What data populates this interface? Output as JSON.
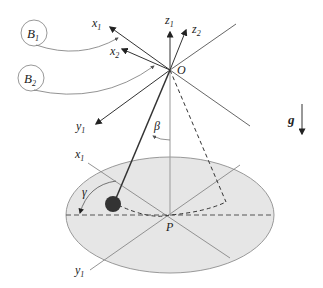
{
  "diagram": {
    "labels": {
      "B1": {
        "main": "B",
        "sub": "1"
      },
      "B2": {
        "main": "B",
        "sub": "2"
      },
      "x1_top": {
        "main": "x",
        "sub": "1"
      },
      "x2_top": {
        "main": "x",
        "sub": "2"
      },
      "y1_top": {
        "main": "y",
        "sub": "1"
      },
      "z1": {
        "main": "z",
        "sub": "1"
      },
      "z2": {
        "main": "z",
        "sub": "2"
      },
      "O": "O",
      "beta": "β",
      "gamma": "γ",
      "g": "g",
      "x1_bottom": {
        "main": "x",
        "sub": "1"
      },
      "y1_bottom": {
        "main": "y",
        "sub": "1"
      },
      "P": "P"
    },
    "colors": {
      "ellipse_fill": "#e6e6e6",
      "ellipse_stroke": "#999999",
      "axis": "#333333",
      "bob": "#333333",
      "thin": "#777777"
    }
  }
}
